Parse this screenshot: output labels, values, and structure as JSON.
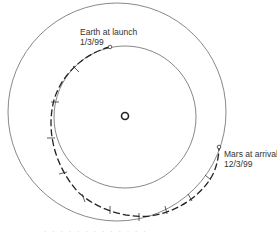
{
  "diagram": {
    "labels": {
      "earth_launch": {
        "line1": "Earth at launch",
        "line2": "1/3/99"
      },
      "mars_arrival": {
        "line1": "Mars at arrival",
        "line2": "12/3/99"
      }
    },
    "caption": "· · · · · · · · · · · · ·",
    "elements": {
      "sun": {
        "cx": 125,
        "cy": 116,
        "r": 4
      },
      "earth_orbit": {
        "cx": 125,
        "cy": 117,
        "r": 71
      },
      "mars_orbit": {
        "cx": 117,
        "cy": 112,
        "r": 109
      },
      "launch_point": {
        "x": 110,
        "y": 47
      },
      "arrival_point": {
        "x": 219,
        "y": 147
      }
    },
    "colors": {
      "orbit": "#555555",
      "trajectory": "#222222",
      "text": "#333333"
    }
  }
}
